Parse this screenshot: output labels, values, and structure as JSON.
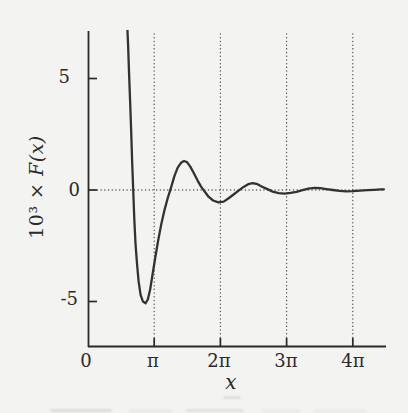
{
  "figure": {
    "background_color": "#f3f3f1",
    "ink_color": "#2b2a28",
    "curve_color": "#333230",
    "grid_dot_color": "#55544f"
  },
  "chart_data": {
    "type": "line",
    "title": "",
    "xlabel": "x",
    "ylabel": "10³ × F(x)",
    "ylabel_parts": {
      "prefix": "10³ ×",
      "function": "F(x)"
    },
    "x_unit": "multiples of π",
    "xlim_over_pi": [
      0,
      4.5
    ],
    "ylim": [
      -7,
      7
    ],
    "grid": {
      "vertical_dotted_at_pi_multiples": [
        1,
        2,
        3,
        4
      ],
      "horizontal_dotted_at_y": 0,
      "style": "dotted"
    },
    "legend": null,
    "xticks": [
      {
        "value_over_pi": 0,
        "label": "0"
      },
      {
        "value_over_pi": 1,
        "label": "π"
      },
      {
        "value_over_pi": 2,
        "label": "2π"
      },
      {
        "value_over_pi": 3,
        "label": "3π"
      },
      {
        "value_over_pi": 4,
        "label": "4π"
      }
    ],
    "yticks": [
      {
        "value": 5,
        "label": "5"
      },
      {
        "value": 0,
        "label": "0"
      },
      {
        "value": -5,
        "label": "-5"
      }
    ],
    "features": {
      "curve_enters_top_clip_at_x_over_pi": 0.6,
      "global_min": {
        "x_over_pi": 0.87,
        "y": -5.05
      },
      "local_max_1": {
        "x_over_pi": 1.46,
        "y": 1.3
      },
      "local_min_2": {
        "x_over_pi": 1.98,
        "y": -0.55
      },
      "local_max_2": {
        "x_over_pi": 2.49,
        "y": 0.31
      },
      "local_min_3": {
        "x_over_pi": 2.97,
        "y": -0.16
      },
      "local_max_3": {
        "x_over_pi": 3.43,
        "y": 0.1
      },
      "local_min_4": {
        "x_over_pi": 3.91,
        "y": -0.06
      }
    },
    "series": [
      {
        "name": "10^3 * F(x)",
        "points_x_over_pi_y": [
          [
            0.593,
            7.3
          ],
          [
            0.605,
            6.5
          ],
          [
            0.62,
            5.3
          ],
          [
            0.636,
            4.0
          ],
          [
            0.652,
            2.6
          ],
          [
            0.668,
            1.2
          ],
          [
            0.684,
            -0.1
          ],
          [
            0.7,
            -1.3
          ],
          [
            0.718,
            -2.4
          ],
          [
            0.74,
            -3.3
          ],
          [
            0.765,
            -4.1
          ],
          [
            0.795,
            -4.7
          ],
          [
            0.83,
            -5.0
          ],
          [
            0.87,
            -5.08
          ],
          [
            0.905,
            -4.9
          ],
          [
            0.94,
            -4.45
          ],
          [
            0.975,
            -3.8
          ],
          [
            1.015,
            -3.05
          ],
          [
            1.06,
            -2.25
          ],
          [
            1.105,
            -1.55
          ],
          [
            1.155,
            -0.9
          ],
          [
            1.205,
            -0.35
          ],
          [
            1.255,
            0.12
          ],
          [
            1.305,
            0.62
          ],
          [
            1.355,
            1.0
          ],
          [
            1.405,
            1.22
          ],
          [
            1.45,
            1.3
          ],
          [
            1.495,
            1.25
          ],
          [
            1.545,
            1.05
          ],
          [
            1.6,
            0.75
          ],
          [
            1.655,
            0.42
          ],
          [
            1.71,
            0.14
          ],
          [
            1.76,
            -0.06
          ],
          [
            1.82,
            -0.3
          ],
          [
            1.89,
            -0.47
          ],
          [
            1.97,
            -0.55
          ],
          [
            2.05,
            -0.52
          ],
          [
            2.12,
            -0.38
          ],
          [
            2.2,
            -0.2
          ],
          [
            2.28,
            -0.02
          ],
          [
            2.35,
            0.14
          ],
          [
            2.42,
            0.26
          ],
          [
            2.49,
            0.31
          ],
          [
            2.56,
            0.26
          ],
          [
            2.63,
            0.15
          ],
          [
            2.71,
            0.04
          ],
          [
            2.79,
            -0.07
          ],
          [
            2.88,
            -0.14
          ],
          [
            2.97,
            -0.16
          ],
          [
            3.06,
            -0.13
          ],
          [
            3.15,
            -0.08
          ],
          [
            3.24,
            -0.01
          ],
          [
            3.33,
            0.06
          ],
          [
            3.42,
            0.1
          ],
          [
            3.51,
            0.08
          ],
          [
            3.6,
            0.04
          ],
          [
            3.7,
            0.0
          ],
          [
            3.8,
            -0.04
          ],
          [
            3.9,
            -0.06
          ],
          [
            4.0,
            -0.05
          ],
          [
            4.11,
            -0.03
          ],
          [
            4.22,
            -0.01
          ],
          [
            4.32,
            0.01
          ],
          [
            4.42,
            0.025
          ],
          [
            4.47,
            0.03
          ]
        ]
      }
    ]
  }
}
